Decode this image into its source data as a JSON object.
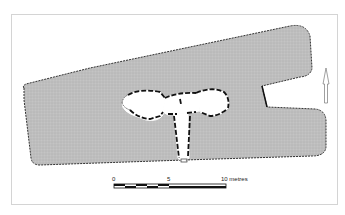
{
  "figure": {
    "type": "archaeological site plan",
    "north_arrow": "north-arrow",
    "scale_bar": {
      "ticks": [
        "0",
        "5",
        "10 metres"
      ],
      "unit": "metres",
      "max": 10
    },
    "colors": {
      "fill": "#bdbdbd",
      "outline": "#333333",
      "wall": "#111111",
      "frame": "#d4d4d4",
      "background": "#ffffff"
    }
  }
}
